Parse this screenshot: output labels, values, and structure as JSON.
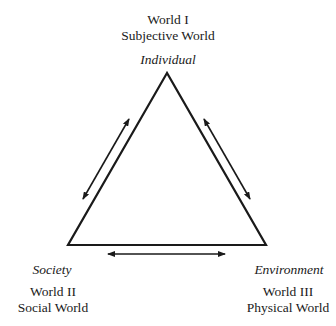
{
  "diagram": {
    "type": "triangle-relationship",
    "nodes": {
      "top": {
        "role": "Individual",
        "world": "World I",
        "name": "Subjective World"
      },
      "bottom_left": {
        "role": "Society",
        "world": "World II",
        "name": "Social World"
      },
      "bottom_right": {
        "role": "Environment",
        "world": "World III",
        "name": "Physical World"
      }
    },
    "edges": [
      {
        "from": "Individual",
        "to": "Society",
        "arrow": "bidirectional"
      },
      {
        "from": "Individual",
        "to": "Environment",
        "arrow": "bidirectional"
      },
      {
        "from": "Society",
        "to": "Environment",
        "arrow": "bidirectional"
      }
    ],
    "colors": {
      "stroke": "#1a1a1a",
      "background": "#ffffff"
    }
  }
}
